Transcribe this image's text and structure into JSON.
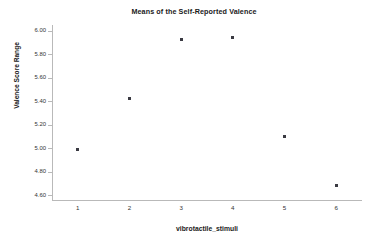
{
  "chart_data": {
    "type": "scatter",
    "title": "Means of the Self-Reported Valence",
    "xlabel": "vibrotactile_stimuli",
    "ylabel": "Valence Score Range",
    "categories": [
      "1",
      "2",
      "3",
      "4",
      "5",
      "6"
    ],
    "x": [
      1,
      2,
      3,
      4,
      5,
      6
    ],
    "values": [
      4.99,
      5.42,
      5.93,
      5.94,
      5.1,
      4.68
    ],
    "xlim": [
      0.5,
      6.5
    ],
    "ylim": [
      4.55,
      6.05
    ],
    "yticks": [
      "6.00",
      "5.80",
      "5.60",
      "5.40",
      "5.20",
      "5.00",
      "4.80",
      "4.60"
    ],
    "ytick_values": [
      6.0,
      5.8,
      5.6,
      5.4,
      5.2,
      5.0,
      4.8,
      4.6
    ],
    "xticks": [
      "1",
      "2",
      "3",
      "4",
      "5",
      "6"
    ],
    "grid": false,
    "legend": false,
    "marker_color": "#3a3a42",
    "axis_color": "#b9b9b9",
    "background": "#ffffff"
  }
}
